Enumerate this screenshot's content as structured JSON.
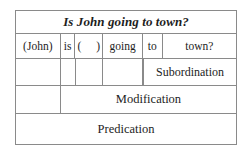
{
  "diagram": {
    "kind": "immediate-constituent-analysis-table",
    "sentence": "Is John going to town?",
    "words_row": {
      "cells": [
        {
          "text": "(John)"
        },
        {
          "text": "is"
        },
        {
          "text": "(   )"
        },
        {
          "text": "going"
        },
        {
          "text": "to"
        },
        {
          "text": "town?"
        }
      ]
    },
    "layers": [
      {
        "label": "Subordination"
      },
      {
        "label": "Modification"
      },
      {
        "label": "Predication"
      }
    ]
  },
  "colors": {
    "border": "#8a8a8a",
    "text": "#1d1d1d",
    "background": "#ffffff"
  }
}
